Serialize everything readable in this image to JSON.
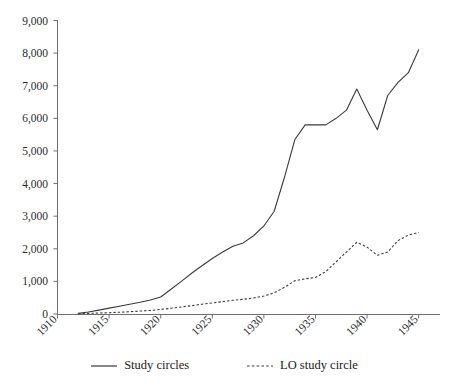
{
  "chart_data": {
    "type": "line",
    "title": "",
    "subtitle": "",
    "xlabel": "",
    "ylabel": "",
    "xlim": [
      1910,
      1946
    ],
    "ylim": [
      0,
      9000
    ],
    "grid": false,
    "legend_position": "bottom",
    "x_ticks": [
      "1910",
      "1915",
      "1920",
      "1925",
      "1930",
      "1935",
      "1940",
      "1945"
    ],
    "x_tick_values": [
      1910,
      1915,
      1920,
      1925,
      1930,
      1935,
      1940,
      1945
    ],
    "y_ticks": [
      "0",
      "1,000",
      "2,000",
      "3,000",
      "4,000",
      "5,000",
      "6,000",
      "7,000",
      "8,000",
      "9,000"
    ],
    "y_tick_values": [
      0,
      1000,
      2000,
      3000,
      4000,
      5000,
      6000,
      7000,
      8000,
      9000
    ],
    "series": [
      {
        "name": "Study circles",
        "style": "solid",
        "color": "#3a3a3a",
        "x": [
          1912,
          1913,
          1914,
          1915,
          1916,
          1917,
          1918,
          1919,
          1920,
          1921,
          1922,
          1923,
          1924,
          1925,
          1926,
          1927,
          1928,
          1929,
          1930,
          1931,
          1932,
          1933,
          1934,
          1935,
          1936,
          1937,
          1938,
          1939,
          1940,
          1941,
          1942,
          1943,
          1944,
          1945
        ],
        "values": [
          20,
          60,
          120,
          180,
          240,
          300,
          360,
          430,
          520,
          760,
          1000,
          1250,
          1480,
          1700,
          1900,
          2080,
          2180,
          2400,
          2700,
          3150,
          4200,
          5350,
          5800,
          5800,
          5800,
          6000,
          6250,
          6900,
          6250,
          5650,
          6700,
          7100,
          7400,
          8100
        ]
      },
      {
        "name": "LO study circle",
        "style": "dashed",
        "color": "#3a3a3a",
        "x": [
          1912,
          1913,
          1914,
          1915,
          1916,
          1917,
          1918,
          1919,
          1920,
          1921,
          1922,
          1923,
          1924,
          1925,
          1926,
          1927,
          1928,
          1929,
          1930,
          1931,
          1932,
          1933,
          1934,
          1935,
          1936,
          1937,
          1938,
          1939,
          1940,
          1941,
          1942,
          1943,
          1944,
          1945
        ],
        "values": [
          10,
          20,
          30,
          40,
          55,
          70,
          90,
          110,
          140,
          175,
          215,
          255,
          300,
          340,
          380,
          420,
          450,
          490,
          550,
          650,
          820,
          1020,
          1080,
          1120,
          1300,
          1600,
          1900,
          2200,
          2050,
          1800,
          1900,
          2250,
          2420,
          2500
        ]
      }
    ]
  },
  "legend": {
    "items": [
      {
        "label": "Study circles",
        "style": "solid"
      },
      {
        "label": "LO study circle",
        "style": "dashed"
      }
    ]
  }
}
